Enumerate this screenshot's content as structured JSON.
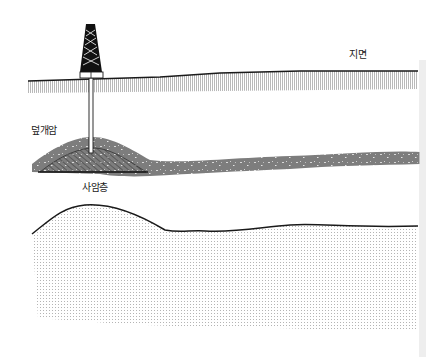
{
  "diagram": {
    "type": "geological-cross-section",
    "labels": {
      "ground_surface": "지면",
      "cap_rock": "덮개암",
      "sandstone_layer": "사암층"
    },
    "elements": [
      {
        "name": "oil-derrick",
        "description": "drilling rig on ground surface"
      },
      {
        "name": "well-pipe",
        "description": "vertical pipe from derrick down into sandstone trap"
      },
      {
        "name": "ground-surface-layer",
        "description": "hatched soil band along top"
      },
      {
        "name": "cap-rock-layer",
        "description": "gray speckled dome-shaped layer"
      },
      {
        "name": "sandstone-layer",
        "description": "diagonally hatched reservoir under cap rock dome"
      },
      {
        "name": "lower-stratum",
        "description": "dotted rock layer with undulating top boundary"
      }
    ],
    "colors": {
      "ink": "#1a1a1a",
      "cap_rock_fill": "#7d7d7d",
      "hatch": "#9a9a9a",
      "dots": "#8a8a8a",
      "background": "#ffffff"
    }
  }
}
